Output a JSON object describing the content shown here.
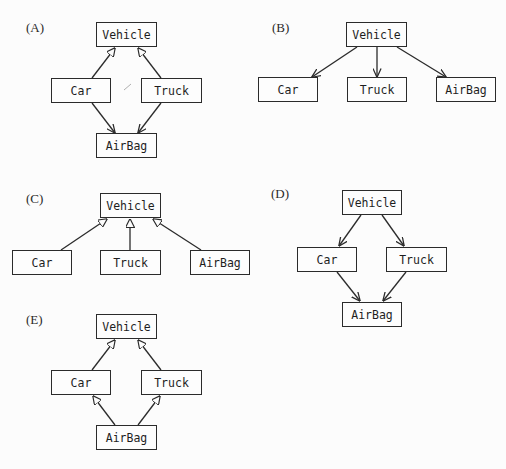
{
  "diagrams": [
    {
      "label": "(A)",
      "nodes": {
        "vehicle": "Vehicle",
        "car": "Car",
        "truck": "Truck",
        "airbag": "AirBag"
      },
      "edges": [
        {
          "from": "Car",
          "to": "Vehicle",
          "arrow": "hollow-triangle"
        },
        {
          "from": "Truck",
          "to": "Vehicle",
          "arrow": "hollow-triangle"
        },
        {
          "from": "Car",
          "to": "AirBag",
          "arrow": "open"
        },
        {
          "from": "Truck",
          "to": "AirBag",
          "arrow": "open"
        }
      ]
    },
    {
      "label": "(B)",
      "nodes": {
        "vehicle": "Vehicle",
        "car": "Car",
        "truck": "Truck",
        "airbag": "AirBag"
      },
      "edges": [
        {
          "from": "Vehicle",
          "to": "Car",
          "arrow": "open"
        },
        {
          "from": "Vehicle",
          "to": "Truck",
          "arrow": "open"
        },
        {
          "from": "Vehicle",
          "to": "AirBag",
          "arrow": "open"
        }
      ]
    },
    {
      "label": "(C)",
      "nodes": {
        "vehicle": "Vehicle",
        "car": "Car",
        "truck": "Truck",
        "airbag": "AirBag"
      },
      "edges": [
        {
          "from": "Car",
          "to": "Vehicle",
          "arrow": "hollow-triangle"
        },
        {
          "from": "Truck",
          "to": "Vehicle",
          "arrow": "hollow-triangle"
        },
        {
          "from": "AirBag",
          "to": "Vehicle",
          "arrow": "hollow-triangle"
        }
      ]
    },
    {
      "label": "(D)",
      "nodes": {
        "vehicle": "Vehicle",
        "car": "Car",
        "truck": "Truck",
        "airbag": "AirBag"
      },
      "edges": [
        {
          "from": "Vehicle",
          "to": "Car",
          "arrow": "open"
        },
        {
          "from": "Vehicle",
          "to": "Truck",
          "arrow": "open"
        },
        {
          "from": "Car",
          "to": "AirBag",
          "arrow": "open"
        },
        {
          "from": "Truck",
          "to": "AirBag",
          "arrow": "open"
        }
      ]
    },
    {
      "label": "(E)",
      "nodes": {
        "vehicle": "Vehicle",
        "car": "Car",
        "truck": "Truck",
        "airbag": "AirBag"
      },
      "edges": [
        {
          "from": "Car",
          "to": "Vehicle",
          "arrow": "hollow-triangle"
        },
        {
          "from": "Truck",
          "to": "Vehicle",
          "arrow": "hollow-triangle"
        },
        {
          "from": "AirBag",
          "to": "Car",
          "arrow": "hollow-triangle"
        },
        {
          "from": "AirBag",
          "to": "Truck",
          "arrow": "hollow-triangle"
        }
      ]
    }
  ]
}
